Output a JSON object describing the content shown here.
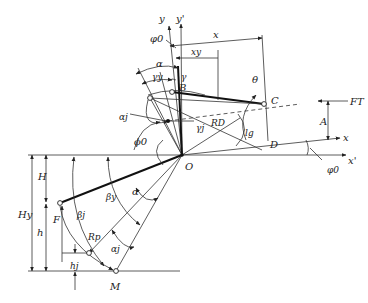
{
  "figure": {
    "type": "geometric-mechanism-diagram",
    "labels": {
      "y": "y",
      "y_prime": "y'",
      "phi0_top": "φ0",
      "x_dim": "x",
      "xy_dim": "xy",
      "alpha_top": "α",
      "gamma_y": "γy",
      "gamma": "γ",
      "B": "B",
      "theta": "θ",
      "C": "C",
      "F_T": "FT",
      "A": "A",
      "alpha_j": "αj",
      "gamma_j": "γj",
      "R_D": "RD",
      "l_g": "lg",
      "phi0_mid": "ϕ0",
      "D": "D",
      "x_axis": "x",
      "O": "O",
      "x_prime_axis": "x'",
      "phi0_right": "φ0",
      "H": "H",
      "H_y": "Hy",
      "h": "h",
      "F": "F",
      "beta_j": "βj",
      "beta_y": "βy",
      "alpha_low": "α",
      "R_p": "Rp",
      "alpha_j_low": "αj",
      "h_j": "hj",
      "M": "M"
    },
    "points": {
      "O": [
        182,
        155
      ],
      "B": [
        172,
        92
      ],
      "C": [
        264,
        104
      ],
      "D": [
        266,
        141
      ],
      "F": [
        60,
        203
      ],
      "M": [
        116,
        271
      ],
      "Rp_node": [
        89,
        253
      ],
      "upper_left_node": [
        150,
        98
      ],
      "aj_point": [
        168,
        121
      ]
    }
  }
}
